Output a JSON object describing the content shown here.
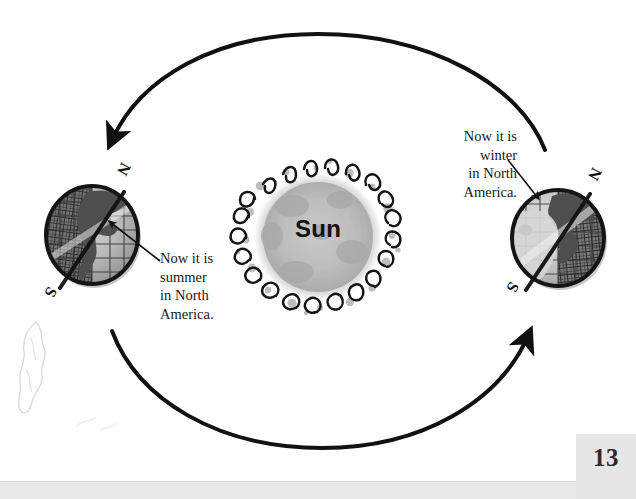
{
  "page": {
    "number": "13",
    "background_color": "#ffffff",
    "band_color": "#e9e9ea",
    "number_box_color": "#e6e6e7"
  },
  "diagram": {
    "title_label": "Sun",
    "sun": {
      "label": "Sun",
      "center_x": 318,
      "center_y": 237,
      "radius": 66,
      "core_color": "#b8b8b8",
      "outer_color": "#9a9a9a",
      "flare_color": "#1a1a1a"
    },
    "orbit_arrows": [
      {
        "name": "top-orbit-arrow",
        "direction": "right-to-left",
        "stroke_color": "#111111",
        "stroke_width": 4
      },
      {
        "name": "bottom-orbit-arrow",
        "direction": "left-to-right",
        "stroke_color": "#111111",
        "stroke_width": 4
      }
    ],
    "earths": [
      {
        "name": "earth-summer",
        "position": "left",
        "center_x": 92,
        "center_y": 235,
        "radius": 47,
        "pole_north_label": "N",
        "pole_south_label": "S",
        "lit_side": "north",
        "callout": "Now it is\nsummer\nin North\nAmerica.",
        "callout_lines": [
          "Now it is",
          "summer",
          "in North",
          "America."
        ]
      },
      {
        "name": "earth-winter",
        "position": "right",
        "center_x": 558,
        "center_y": 238,
        "radius": 47,
        "pole_north_label": "N",
        "pole_south_label": "S",
        "lit_side": "south",
        "callout": "Now it is\nwinter\nin North\nAmerica.",
        "callout_lines": [
          "Now it is",
          "winter",
          "in North",
          "America."
        ]
      }
    ]
  },
  "callouts": {
    "left": "Now it is\nsummer\nin North\nAmerica.",
    "right": "Now it is\nwinter\nin North\nAmerica."
  },
  "compass_labels": {
    "left_north": "N",
    "left_south": "S",
    "right_north": "N",
    "right_south": "S"
  }
}
